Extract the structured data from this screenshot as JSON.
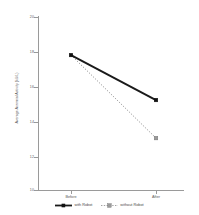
{
  "chart_data": {
    "type": "line",
    "title": "",
    "xlabel": "",
    "ylabel": "Average Acromial Activity (kU/L)",
    "categories": [
      "Before",
      "After"
    ],
    "x_tick_labels": [
      "Before",
      "After"
    ],
    "y_tick_labels": [
      "20",
      "18",
      "16",
      "14",
      "12",
      "10"
    ],
    "y_ticks": [
      20,
      18,
      16,
      14,
      12,
      10
    ],
    "ylim": [
      10,
      20
    ],
    "grid": false,
    "legend_position": "bottom",
    "series": [
      {
        "name": "with Robot",
        "values": [
          17.8,
          15.2
        ],
        "color": "#1a1a1a",
        "linestyle": "solid",
        "marker": "square"
      },
      {
        "name": "without Robot",
        "values": [
          17.8,
          13.0
        ],
        "color": "#8c8c8c",
        "linestyle": "dotted",
        "marker": "square"
      }
    ]
  },
  "axis": {
    "y_title": "Average Acromial Activity (kU/L)",
    "tick_20": "20",
    "tick_18": "18",
    "tick_16": "16",
    "tick_14": "14",
    "tick_12": "12",
    "tick_10": "10",
    "x_before": "Before",
    "x_after": "After"
  },
  "legend": {
    "entries": [
      {
        "label": "with Robot"
      },
      {
        "label": "without Robot"
      }
    ]
  }
}
